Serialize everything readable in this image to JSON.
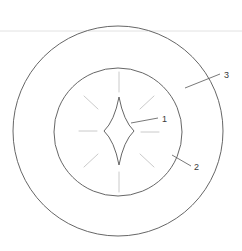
{
  "figure": {
    "background_color": "#ffffff",
    "width": 242,
    "height": 251,
    "stroke_color": "#555555",
    "faint_stroke_color": "#b8b8b8",
    "rule_color": "#e2e2e2",
    "label_color": "#3a3a3a"
  },
  "header_rule": {
    "name": "horizontal-rule",
    "y": 31,
    "x_start": 0,
    "x_end": 242
  },
  "shapes": {
    "outer_circle": {
      "name": "outer-circle",
      "cx": 118,
      "cy": 131,
      "r": 105,
      "stroke_width": 0.9
    },
    "inner_circle": {
      "name": "inner-circle",
      "cx": 118,
      "cy": 132,
      "r": 64,
      "stroke_width": 0.9
    },
    "star": {
      "name": "four-pointed-star",
      "cx": 119,
      "cy": 131,
      "half_width": 15,
      "half_height": 34,
      "stroke_width": 0.9
    }
  },
  "rays": {
    "name": "radiating-dashes",
    "color": "#c4c4c4",
    "stroke_width": 0.9,
    "items": [
      {
        "id": "ray-top",
        "x1": 119,
        "y1": 72,
        "x2": 119,
        "y2": 92
      },
      {
        "id": "ray-bottom",
        "x1": 119,
        "y1": 172,
        "x2": 119,
        "y2": 192
      },
      {
        "id": "ray-left",
        "x1": 79,
        "y1": 131,
        "x2": 97,
        "y2": 131
      },
      {
        "id": "ray-right",
        "x1": 141,
        "y1": 132,
        "x2": 159,
        "y2": 132
      },
      {
        "id": "ray-upper-left",
        "x1": 84,
        "y1": 96,
        "x2": 98,
        "y2": 109
      },
      {
        "id": "ray-upper-right",
        "x1": 140,
        "y1": 109,
        "x2": 154,
        "y2": 96
      },
      {
        "id": "ray-lower-left",
        "x1": 84,
        "y1": 167,
        "x2": 98,
        "y2": 154
      },
      {
        "id": "ray-lower-right",
        "x1": 140,
        "y1": 154,
        "x2": 154,
        "y2": 167
      }
    ]
  },
  "callouts": [
    {
      "id": "callout-1",
      "label": "1",
      "target": "four-pointed-star",
      "leader": {
        "x1": 131,
        "y1": 123,
        "x2": 158,
        "y2": 118
      },
      "text_x": 162,
      "text_y": 122
    },
    {
      "id": "callout-2",
      "label": "2",
      "target": "inner-circle",
      "leader": {
        "x1": 172,
        "y1": 155,
        "x2": 191,
        "y2": 166
      },
      "text_x": 194,
      "text_y": 170
    },
    {
      "id": "callout-3",
      "label": "3",
      "target": "outer-circle",
      "leader": {
        "x1": 185,
        "y1": 88,
        "x2": 220,
        "y2": 74
      },
      "text_x": 224,
      "text_y": 78
    }
  ]
}
